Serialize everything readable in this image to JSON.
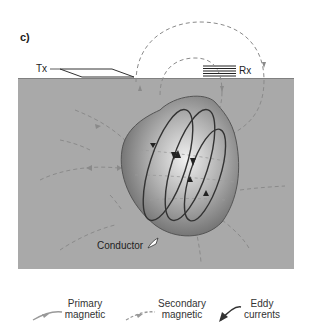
{
  "figure": {
    "panel_label": "c)",
    "background_text_lines": [
      "",
      ""
    ],
    "labels": {
      "transmitter": "Tx",
      "receiver": "Rx",
      "conductor": "Conductor"
    },
    "colors": {
      "ground": "#a9a9a9",
      "surface_line": "#7a7a7a",
      "conductor_fill_center": "#e8e8e8",
      "conductor_fill_edge": "#6e6e6e",
      "eddy_current": "#3a3a3a",
      "primary_field": "#8c8c8c",
      "secondary_field": "#8c8c8c"
    }
  },
  "legend": {
    "items": [
      {
        "name": "primary",
        "line1": "Primary",
        "line2": "magnetic"
      },
      {
        "name": "secondary",
        "line1": "Secondary",
        "line2": "magnetic"
      },
      {
        "name": "eddy",
        "line1": "Eddy",
        "line2": "currents"
      }
    ]
  }
}
